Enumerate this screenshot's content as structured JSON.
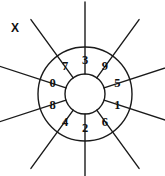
{
  "figure": {
    "label_x": "X",
    "type": "radial-wheel-diagram",
    "geometry": {
      "center_x": 85,
      "center_y": 94,
      "outer_radius": 47,
      "inner_radius": 20,
      "spoke_outer_radius": 92,
      "sector_count": 10,
      "sector_angle_degrees": 36,
      "first_boundary_angle_degrees": -18,
      "stroke_color": "#1a1a1a",
      "stroke_width": 1.4,
      "background_color": "#ffffff",
      "text_color": "#111111"
    },
    "sectors": [
      {
        "digit": "3",
        "center_angle_degrees": -90,
        "position": "top"
      },
      {
        "digit": "9",
        "center_angle_degrees": -54,
        "position": "upper-right"
      },
      {
        "digit": "5",
        "center_angle_degrees": -18,
        "position": "right-upper"
      },
      {
        "digit": "1",
        "center_angle_degrees": 18,
        "position": "right-lower"
      },
      {
        "digit": "6",
        "center_angle_degrees": 54,
        "position": "lower-right"
      },
      {
        "digit": "2",
        "center_angle_degrees": 90,
        "position": "bottom"
      },
      {
        "digit": "4",
        "center_angle_degrees": 126,
        "position": "lower-left"
      },
      {
        "digit": "8",
        "center_angle_degrees": 162,
        "position": "left-lower"
      },
      {
        "digit": "0",
        "center_angle_degrees": 198,
        "position": "left-upper"
      },
      {
        "digit": "7",
        "center_angle_degrees": 234,
        "position": "upper-left"
      }
    ],
    "digits_clockwise_from_top": [
      "3",
      "9",
      "5",
      "1",
      "6",
      "2",
      "4",
      "8",
      "0",
      "7"
    ]
  }
}
